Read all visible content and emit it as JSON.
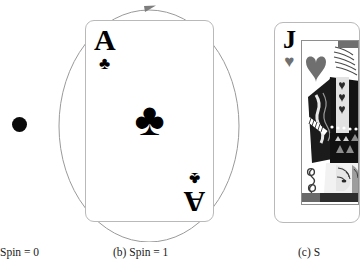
{
  "figure": {
    "type": "figure-illustration",
    "background_color": "#ffffff",
    "width": 340,
    "height": 266
  },
  "panels": [
    {
      "id": "a",
      "caption": "Spin = 0",
      "object_name": "black-dot",
      "object_description": "solid black filled circle",
      "color": "#0a0a0a"
    },
    {
      "id": "b",
      "caption": "(b) Spin = 1",
      "object_name": "ace-of-clubs-card",
      "card": {
        "rank": "A",
        "suit_name": "clubs",
        "suit_glyph": "♣",
        "suit_color": "#000000",
        "corner_top_left_rank": "A",
        "corner_bottom_right_rank": "A",
        "center_pip": "♣",
        "face_color": "#ffffff",
        "border_color": "#b9b9b9"
      },
      "annotation": {
        "name": "rotation-ellipse",
        "description": "thin grey ellipse with clockwise arrowhead at top",
        "stroke_color": "#9a9a9a",
        "arrow_direction": "clockwise"
      }
    },
    {
      "id": "c",
      "caption": "(c) S",
      "caption_truncated": true,
      "object_name": "jack-of-hearts-card",
      "card": {
        "rank": "J",
        "suit_name": "hearts",
        "suit_glyph": "♥",
        "suit_color": "#6f6f6f",
        "corner_top_left_rank": "J",
        "center_pip": "♥",
        "face_color": "#ffffff",
        "border_color": "#b9b9b9",
        "artwork": "court-card-figure"
      }
    }
  ],
  "captions": {
    "a": "Spin = 0",
    "b": "(b) Spin = 1",
    "c": "(c) S"
  },
  "colors": {
    "ink": "#000000",
    "grey_stroke": "#9a9a9a",
    "card_border": "#b9b9b9",
    "art_grey": "#6f6f6f",
    "art_light": "#d8d8d8"
  }
}
